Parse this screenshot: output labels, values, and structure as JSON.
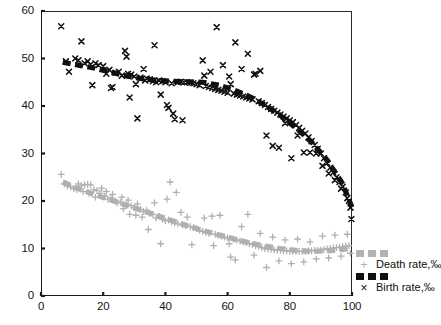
{
  "chart_data": {
    "type": "scatter",
    "title": "",
    "xlabel": "",
    "ylabel": "",
    "xlim": [
      0,
      100
    ],
    "ylim": [
      0,
      60
    ],
    "xticks": [
      0,
      20,
      40,
      60,
      80,
      100
    ],
    "yticks": [
      0,
      10,
      20,
      30,
      40,
      50,
      60
    ],
    "grid": false,
    "legend_position": "right-bottom-outside",
    "series": [
      {
        "name": "Death rate,‰",
        "marker": "plus",
        "color": "#b0b0b0",
        "trend_style": "thick-dashed",
        "points": [
          [
            6.5,
            25.6
          ],
          [
            7.5,
            23.6
          ],
          [
            8.5,
            23.2
          ],
          [
            9.5,
            23.0
          ],
          [
            10.5,
            22.6
          ],
          [
            11.5,
            22.4
          ],
          [
            12.0,
            23.6
          ],
          [
            13.0,
            23.3
          ],
          [
            13.5,
            22.0
          ],
          [
            14.0,
            23.4
          ],
          [
            15.0,
            23.5
          ],
          [
            15.5,
            21.6
          ],
          [
            16.0,
            23.4
          ],
          [
            17.0,
            22.4
          ],
          [
            17.5,
            20.8
          ],
          [
            18.0,
            22.2
          ],
          [
            19.0,
            21.6
          ],
          [
            19.5,
            22.7
          ],
          [
            20.5,
            21.0
          ],
          [
            21.0,
            22.0
          ],
          [
            21.5,
            20.4
          ],
          [
            22.5,
            20.6
          ],
          [
            23.0,
            21.4
          ],
          [
            24.0,
            20.0
          ],
          [
            24.5,
            19.6
          ],
          [
            25.5,
            19.8
          ],
          [
            26.0,
            20.8
          ],
          [
            26.5,
            18.4
          ],
          [
            27.5,
            19.2
          ],
          [
            28.0,
            20.2
          ],
          [
            28.5,
            17.2
          ],
          [
            29.0,
            19.0
          ],
          [
            30.0,
            18.6
          ],
          [
            30.5,
            17.0
          ],
          [
            31.0,
            19.4
          ],
          [
            32.0,
            18.2
          ],
          [
            32.5,
            16.6
          ],
          [
            33.0,
            17.8
          ],
          [
            34.0,
            18.0
          ],
          [
            34.5,
            14.0
          ],
          [
            35.0,
            17.4
          ],
          [
            36.0,
            17.2
          ],
          [
            36.5,
            19.6
          ],
          [
            37.0,
            16.4
          ],
          [
            38.0,
            16.8
          ],
          [
            38.5,
            11.0
          ],
          [
            39.0,
            16.2
          ],
          [
            40.0,
            15.8
          ],
          [
            40.5,
            20.4
          ],
          [
            41.0,
            16.0
          ],
          [
            41.5,
            24.0
          ],
          [
            42.0,
            15.6
          ],
          [
            43.0,
            15.4
          ],
          [
            43.5,
            21.8
          ],
          [
            44.0,
            15.2
          ],
          [
            45.0,
            17.6
          ],
          [
            45.5,
            15.0
          ],
          [
            46.5,
            14.8
          ],
          [
            47.0,
            16.6
          ],
          [
            48.0,
            14.6
          ],
          [
            48.5,
            10.8
          ],
          [
            49.0,
            14.4
          ],
          [
            50.0,
            14.2
          ],
          [
            51.0,
            13.8
          ],
          [
            52.0,
            13.6
          ],
          [
            52.5,
            16.4
          ],
          [
            53.0,
            13.4
          ],
          [
            54.0,
            13.2
          ],
          [
            55.0,
            16.8
          ],
          [
            55.5,
            10.6
          ],
          [
            56.0,
            13.0
          ],
          [
            57.0,
            12.8
          ],
          [
            57.5,
            17.0
          ],
          [
            58.0,
            12.6
          ],
          [
            59.0,
            12.4
          ],
          [
            60.0,
            12.2
          ],
          [
            60.5,
            11.0
          ],
          [
            61.0,
            8.2
          ],
          [
            62.0,
            12.0
          ],
          [
            62.5,
            7.6
          ],
          [
            63.0,
            11.8
          ],
          [
            64.0,
            11.6
          ],
          [
            64.5,
            14.6
          ],
          [
            65.0,
            11.4
          ],
          [
            66.0,
            11.2
          ],
          [
            66.5,
            17.2
          ],
          [
            67.0,
            11.0
          ],
          [
            68.0,
            10.8
          ],
          [
            68.5,
            8.6
          ],
          [
            69.0,
            10.6
          ],
          [
            70.0,
            10.4
          ],
          [
            70.5,
            13.2
          ],
          [
            71.0,
            10.2
          ],
          [
            72.0,
            10.0
          ],
          [
            72.5,
            6.0
          ],
          [
            73.0,
            9.9
          ],
          [
            74.0,
            9.8
          ],
          [
            74.5,
            12.4
          ],
          [
            75.0,
            9.7
          ],
          [
            76.0,
            9.6
          ],
          [
            76.5,
            7.4
          ],
          [
            77.0,
            9.6
          ],
          [
            78.0,
            9.5
          ],
          [
            78.5,
            11.8
          ],
          [
            79.0,
            9.5
          ],
          [
            80.0,
            9.4
          ],
          [
            80.5,
            6.8
          ],
          [
            81.0,
            9.4
          ],
          [
            82.0,
            9.4
          ],
          [
            82.5,
            12.0
          ],
          [
            83.0,
            9.4
          ],
          [
            84.0,
            9.4
          ],
          [
            84.5,
            7.2
          ],
          [
            85.0,
            9.4
          ],
          [
            86.0,
            9.5
          ],
          [
            86.5,
            11.4
          ],
          [
            87.0,
            9.5
          ],
          [
            88.0,
            9.6
          ],
          [
            88.5,
            7.8
          ],
          [
            89.0,
            9.6
          ],
          [
            90.0,
            9.7
          ],
          [
            90.5,
            12.6
          ],
          [
            91.0,
            9.8
          ],
          [
            92.0,
            9.9
          ],
          [
            92.5,
            8.0
          ],
          [
            93.0,
            10.0
          ],
          [
            94.0,
            10.1
          ],
          [
            94.5,
            12.8
          ],
          [
            95.0,
            10.2
          ],
          [
            96.0,
            10.3
          ],
          [
            96.5,
            8.4
          ],
          [
            97.0,
            10.4
          ],
          [
            98.0,
            10.5
          ],
          [
            98.5,
            13.0
          ],
          [
            99.0,
            10.6
          ],
          [
            99.5,
            9.0
          ]
        ],
        "trend": [
          [
            7,
            24.0
          ],
          [
            12,
            22.6
          ],
          [
            17,
            21.4
          ],
          [
            22,
            20.3
          ],
          [
            27,
            19.2
          ],
          [
            32,
            18.1
          ],
          [
            37,
            17.0
          ],
          [
            42,
            15.9
          ],
          [
            47,
            14.8
          ],
          [
            52,
            13.8
          ],
          [
            57,
            12.9
          ],
          [
            62,
            12.0
          ],
          [
            67,
            11.2
          ],
          [
            72,
            10.5
          ],
          [
            77,
            10.0
          ],
          [
            82,
            9.6
          ],
          [
            87,
            9.4
          ],
          [
            92,
            9.5
          ],
          [
            97,
            9.8
          ],
          [
            100,
            10.0
          ]
        ]
      },
      {
        "name": "Birth rate,‰",
        "marker": "x",
        "color": "#101010",
        "trend_style": "thick-dashed",
        "points": [
          [
            6.5,
            56.8
          ],
          [
            8.0,
            49.4
          ],
          [
            9.0,
            47.2
          ],
          [
            11.0,
            50.0
          ],
          [
            12.0,
            49.6
          ],
          [
            13.0,
            53.6
          ],
          [
            14.0,
            49.0
          ],
          [
            15.0,
            49.4
          ],
          [
            16.0,
            48.8
          ],
          [
            16.5,
            44.4
          ],
          [
            17.5,
            49.0
          ],
          [
            18.5,
            48.6
          ],
          [
            20.0,
            48.4
          ],
          [
            21.0,
            46.8
          ],
          [
            22.0,
            47.6
          ],
          [
            22.5,
            43.8
          ],
          [
            23.0,
            44.0
          ],
          [
            24.0,
            47.0
          ],
          [
            25.0,
            47.2
          ],
          [
            26.0,
            46.4
          ],
          [
            27.0,
            51.6
          ],
          [
            27.5,
            50.4
          ],
          [
            28.0,
            46.8
          ],
          [
            28.5,
            41.8
          ],
          [
            29.0,
            46.6
          ],
          [
            30.0,
            46.2
          ],
          [
            30.5,
            44.6
          ],
          [
            31.0,
            37.4
          ],
          [
            32.0,
            46.0
          ],
          [
            33.0,
            47.8
          ],
          [
            33.5,
            45.4
          ],
          [
            34.0,
            45.8
          ],
          [
            35.0,
            45.6
          ],
          [
            36.0,
            45.2
          ],
          [
            36.5,
            52.8
          ],
          [
            37.0,
            45.0
          ],
          [
            38.0,
            45.4
          ],
          [
            38.5,
            42.4
          ],
          [
            39.0,
            45.2
          ],
          [
            40.0,
            45.0
          ],
          [
            40.5,
            40.2
          ],
          [
            41.0,
            39.6
          ],
          [
            42.0,
            44.8
          ],
          [
            42.5,
            38.4
          ],
          [
            43.0,
            37.2
          ],
          [
            44.0,
            45.0
          ],
          [
            45.0,
            45.1
          ],
          [
            45.5,
            37.0
          ],
          [
            46.0,
            45.0
          ],
          [
            47.0,
            45.0
          ],
          [
            48.0,
            44.9
          ],
          [
            49.0,
            44.8
          ],
          [
            50.0,
            44.6
          ],
          [
            51.0,
            44.4
          ],
          [
            52.0,
            49.6
          ],
          [
            52.5,
            46.4
          ],
          [
            53.0,
            44.2
          ],
          [
            54.0,
            44.0
          ],
          [
            54.5,
            47.2
          ],
          [
            55.0,
            43.8
          ],
          [
            56.0,
            43.6
          ],
          [
            56.5,
            56.6
          ],
          [
            57.0,
            43.4
          ],
          [
            58.0,
            43.2
          ],
          [
            58.5,
            48.6
          ],
          [
            59.0,
            43.0
          ],
          [
            60.0,
            42.8
          ],
          [
            60.5,
            46.2
          ],
          [
            61.0,
            44.6
          ],
          [
            62.0,
            42.6
          ],
          [
            62.5,
            53.4
          ],
          [
            63.0,
            42.4
          ],
          [
            64.0,
            42.2
          ],
          [
            64.5,
            47.8
          ],
          [
            65.0,
            42.0
          ],
          [
            66.0,
            41.8
          ],
          [
            66.5,
            51.0
          ],
          [
            67.0,
            41.6
          ],
          [
            68.0,
            41.4
          ],
          [
            68.5,
            46.6
          ],
          [
            69.0,
            46.8
          ],
          [
            70.0,
            41.0
          ],
          [
            70.5,
            47.4
          ],
          [
            71.0,
            40.6
          ],
          [
            72.0,
            40.2
          ],
          [
            72.5,
            33.8
          ],
          [
            73.0,
            39.8
          ],
          [
            74.0,
            39.4
          ],
          [
            74.5,
            31.6
          ],
          [
            75.0,
            39.0
          ],
          [
            76.0,
            38.6
          ],
          [
            76.5,
            31.2
          ],
          [
            77.0,
            38.2
          ],
          [
            78.0,
            37.8
          ],
          [
            78.5,
            36.4
          ],
          [
            79.0,
            37.4
          ],
          [
            80.0,
            37.0
          ],
          [
            80.5,
            29.0
          ],
          [
            81.0,
            36.6
          ],
          [
            82.0,
            36.0
          ],
          [
            82.5,
            33.8
          ],
          [
            83.0,
            35.4
          ],
          [
            84.0,
            34.8
          ],
          [
            84.5,
            30.2
          ],
          [
            85.0,
            34.2
          ],
          [
            86.0,
            33.4
          ],
          [
            86.5,
            30.2
          ],
          [
            87.0,
            32.6
          ],
          [
            88.0,
            31.8
          ],
          [
            88.5,
            30.0
          ],
          [
            89.0,
            31.0
          ],
          [
            90.0,
            30.0
          ],
          [
            90.5,
            27.4
          ],
          [
            91.0,
            29.0
          ],
          [
            92.0,
            28.0
          ],
          [
            92.5,
            25.8
          ],
          [
            93.0,
            27.0
          ],
          [
            94.0,
            26.0
          ],
          [
            94.5,
            24.4
          ],
          [
            95.0,
            25.0
          ],
          [
            96.0,
            24.0
          ],
          [
            96.5,
            22.6
          ],
          [
            97.0,
            23.0
          ],
          [
            98.0,
            21.8
          ],
          [
            98.5,
            20.6
          ],
          [
            99.0,
            20.0
          ],
          [
            99.5,
            18.6
          ],
          [
            99.8,
            16.2
          ]
        ],
        "trend": [
          [
            7,
            49.2
          ],
          [
            12,
            48.6
          ],
          [
            17,
            48.0
          ],
          [
            22,
            47.2
          ],
          [
            27,
            46.4
          ],
          [
            32,
            45.8
          ],
          [
            37,
            45.4
          ],
          [
            42,
            45.2
          ],
          [
            47,
            45.1
          ],
          [
            52,
            45.0
          ],
          [
            57,
            44.4
          ],
          [
            62,
            43.4
          ],
          [
            67,
            42.0
          ],
          [
            72,
            40.2
          ],
          [
            77,
            38.0
          ],
          [
            82,
            35.4
          ],
          [
            87,
            32.4
          ],
          [
            92,
            28.6
          ],
          [
            97,
            23.6
          ],
          [
            100,
            18.6
          ]
        ]
      }
    ]
  },
  "legend": {
    "entries": [
      {
        "label": "Death rate,‰",
        "marker_glyph": "+",
        "color": "#b0b0b0"
      },
      {
        "label": "Birth rate,‰",
        "marker_glyph": "×",
        "color": "#101010"
      }
    ]
  }
}
